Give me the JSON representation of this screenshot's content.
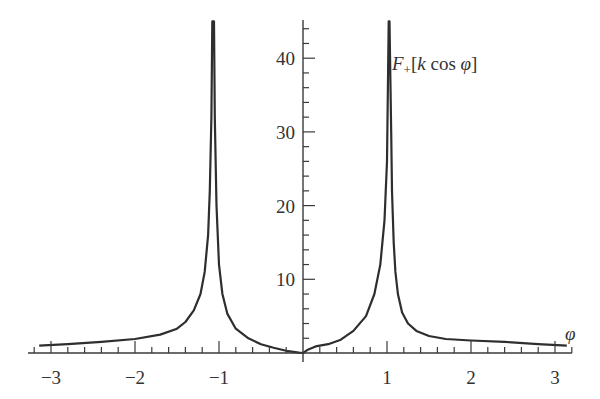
{
  "chart_data": {
    "type": "line",
    "title": "",
    "xlabel": "φ",
    "ylabel": "F₊[k cos φ]",
    "function_label": {
      "F": "F",
      "sub": "+",
      "bracket_open": "[",
      "k": "k",
      "cos": " cos ",
      "phi": "φ",
      "bracket_close": "]"
    },
    "xlim": [
      -3.25,
      3.25
    ],
    "ylim": [
      0,
      45
    ],
    "x_ticks": [
      -3,
      -2,
      -1,
      1,
      2,
      3
    ],
    "x_tick_labels": [
      "−3",
      "−2",
      "−1",
      "1",
      "2",
      "3"
    ],
    "y_ticks": [
      10,
      20,
      30,
      40
    ],
    "y_tick_labels": [
      "10",
      "20",
      "30",
      "40"
    ],
    "grid": false,
    "legend": null,
    "series": [
      {
        "name": "F+[k cos φ]",
        "x": [
          -3.14,
          -2.8,
          -2.4,
          -2.0,
          -1.7,
          -1.5,
          -1.4,
          -1.3,
          -1.22,
          -1.17,
          -1.13,
          -1.11,
          -1.09,
          -1.08,
          -1.06,
          -1.05,
          -1.03,
          -1.0,
          -0.96,
          -0.9,
          -0.8,
          -0.65,
          -0.5,
          -0.35,
          -0.2,
          -0.05,
          0.0,
          0.05,
          0.15,
          0.3,
          0.45,
          0.6,
          0.75,
          0.85,
          0.92,
          0.97,
          1.0,
          1.02,
          1.03,
          1.05,
          1.06,
          1.08,
          1.1,
          1.13,
          1.18,
          1.25,
          1.35,
          1.5,
          1.7,
          2.0,
          2.4,
          2.8,
          3.14
        ],
        "y": [
          1.0,
          1.2,
          1.5,
          1.9,
          2.5,
          3.3,
          4.2,
          5.8,
          8.0,
          11.0,
          16.0,
          22.0,
          32.0,
          45.0,
          45.0,
          32.0,
          20.0,
          12.0,
          8.0,
          5.3,
          3.3,
          2.0,
          1.2,
          0.7,
          0.3,
          0.05,
          0.0,
          0.4,
          0.9,
          1.2,
          1.8,
          3.0,
          5.0,
          8.0,
          12.0,
          18.0,
          26.0,
          45.0,
          45.0,
          30.0,
          22.0,
          15.0,
          11.0,
          8.0,
          5.5,
          4.0,
          3.0,
          2.3,
          1.9,
          1.7,
          1.5,
          1.2,
          1.0
        ]
      }
    ]
  }
}
